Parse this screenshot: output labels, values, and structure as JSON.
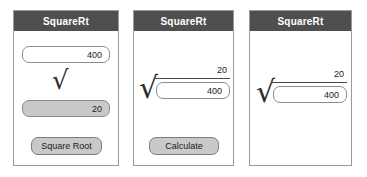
{
  "panels": [
    {
      "title": "SquareRt",
      "input_value": "400",
      "radical_icon": "radical-sign",
      "result_value": "20",
      "button_label": "Square Root",
      "has_button": true
    },
    {
      "title": "SquareRt",
      "radical_icon": "radical-sign",
      "over_value": "20",
      "input_value": "400",
      "button_label": "Calculate",
      "has_button": true
    },
    {
      "title": "SquareRt",
      "radical_icon": "radical-sign",
      "over_value": "20",
      "input_value": "400",
      "has_button": false
    }
  ],
  "colors": {
    "titlebar_background": "#4f4f4f",
    "titlebar_text": "#ffffff",
    "panel_border": "#9a9a9a",
    "field_border": "#8c8c8c",
    "result_field_background": "#c9c9c9",
    "button_background": "#c9c9c9",
    "page_background": "#ffffff"
  }
}
